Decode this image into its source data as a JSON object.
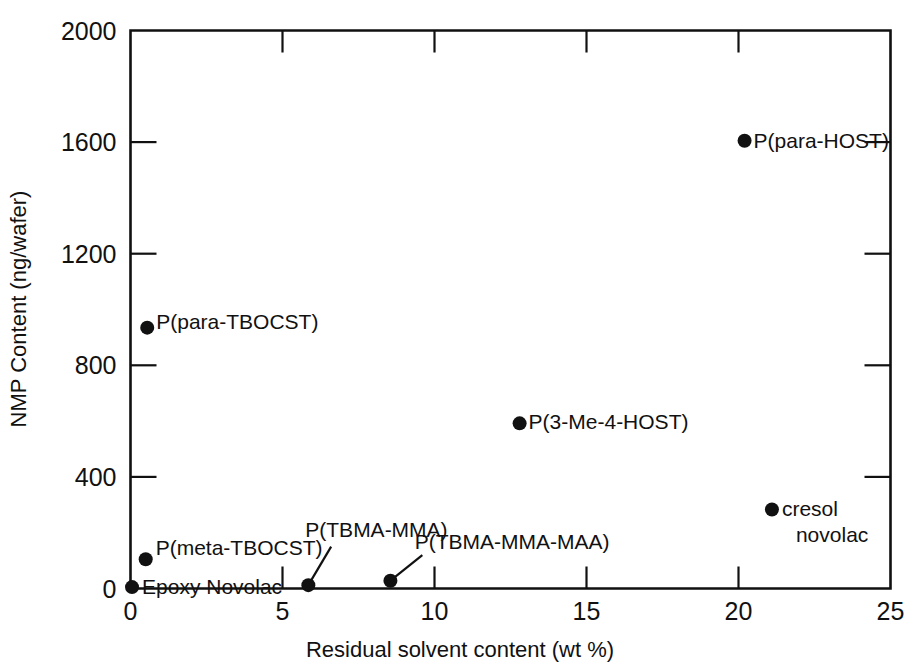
{
  "chart_data": {
    "type": "scatter",
    "title": "",
    "xlabel": "Residual solvent content (wt %)",
    "ylabel": "NMP Content (ng/wafer)",
    "xlim": [
      0,
      25
    ],
    "ylim": [
      0,
      2000
    ],
    "xticks": [
      0,
      5,
      10,
      15,
      20,
      25
    ],
    "yticks": [
      0,
      400,
      800,
      1200,
      1600,
      2000
    ],
    "xtick_labels": [
      "0",
      "5",
      "10",
      "15",
      "20",
      "25"
    ],
    "ytick_labels": [
      "0",
      "400",
      "800",
      "1200",
      "1600",
      "2000"
    ],
    "grid": false,
    "legend": "none",
    "points": [
      {
        "label": "P(para-HOST)",
        "x": 20.2,
        "y": 1605,
        "label_dx": 9,
        "label_dy": 7,
        "label_anchor": "start",
        "leader": false
      },
      {
        "label": "P(para-TBOCST)",
        "x": 0.55,
        "y": 935,
        "label_dx": 9,
        "label_dy": 1,
        "label_anchor": "start",
        "leader": false
      },
      {
        "label": "P(3-Me-4-HOST)",
        "x": 12.8,
        "y": 592,
        "label_dx": 9,
        "label_dy": 6,
        "label_anchor": "start",
        "leader": false
      },
      {
        "label": "cresol",
        "label2": "novolac",
        "x": 21.1,
        "y": 283,
        "label_dx": 10,
        "label_dy": 6,
        "label_anchor": "start",
        "leader": false
      },
      {
        "label": "P(meta-TBOCST)",
        "x": 0.5,
        "y": 105,
        "label_dx": 10,
        "label_dy": -4,
        "label_anchor": "start",
        "leader": false
      },
      {
        "label": "Epoxy Novolac",
        "x": 0.05,
        "y": 5,
        "label_dx": 10,
        "label_dy": 7,
        "label_anchor": "start",
        "leader": false
      },
      {
        "label": "P(TBMA-MMA)",
        "x": 5.85,
        "y": 12,
        "label_dx": 0,
        "label_dy": 0,
        "label_anchor": "start",
        "leader": true,
        "leader_x": 6.6,
        "leader_y": 150,
        "label_x": 5.75,
        "label_y": 185
      },
      {
        "label": "P(TBMA-MMA-MAA)",
        "x": 8.55,
        "y": 28,
        "label_dx": 0,
        "label_dy": 0,
        "label_anchor": "start",
        "leader": true,
        "leader_x": 9.6,
        "leader_y": 120,
        "label_x": 9.35,
        "label_y": 142
      }
    ]
  },
  "axes": {
    "x_title": "Residual solvent content (wt %)",
    "y_title": "NMP Content (ng/wafer)"
  },
  "colors": {
    "ink": "#111111",
    "background": "#ffffff"
  }
}
